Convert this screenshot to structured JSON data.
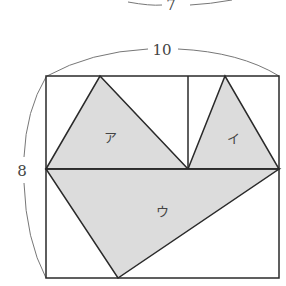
{
  "diagram": {
    "top_label": "7",
    "width_label": "10",
    "height_label": "8",
    "regions": [
      {
        "id": "a",
        "label": "ア"
      },
      {
        "id": "i",
        "label": "イ"
      },
      {
        "id": "u",
        "label": "ウ"
      }
    ],
    "colors": {
      "line": "#2a2a2a",
      "fill": "#dcdcdc",
      "brace": "#777777"
    }
  }
}
